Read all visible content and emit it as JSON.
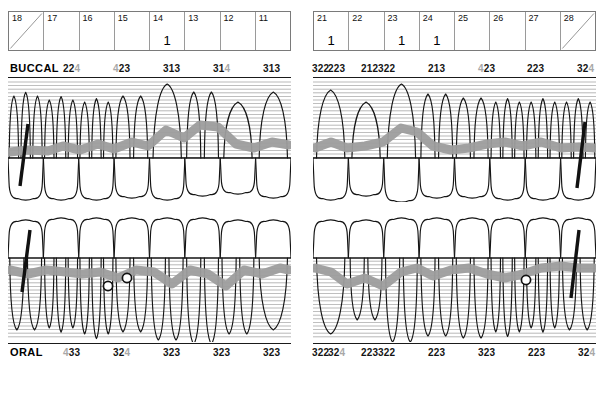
{
  "chart_type": "periodontal-dental-chart",
  "colors": {
    "ink": "#141414",
    "muted_digit": "#a8a8a8",
    "gingiva_band": "#9d9d9d",
    "hatch_line": "#8a8a8a",
    "grid_line": "#7a7a7a"
  },
  "quadrants": {
    "upper_left": {
      "grid_id": "grid-left",
      "tooth_numbers": [
        "18",
        "17",
        "16",
        "15",
        "14",
        "13",
        "12",
        "11"
      ],
      "cell_marks": [
        "",
        "",
        "",
        "",
        "1",
        "",
        "",
        ""
      ],
      "missing_diagonal": [
        true,
        false,
        false,
        false,
        false,
        false,
        false,
        false
      ]
    },
    "upper_right": {
      "grid_id": "grid-right",
      "tooth_numbers": [
        "21",
        "22",
        "23",
        "24",
        "25",
        "26",
        "27",
        "28"
      ],
      "cell_marks": [
        "1",
        "",
        "1",
        "1",
        "",
        "",
        "",
        ""
      ],
      "missing_diagonal": [
        false,
        false,
        false,
        false,
        false,
        false,
        false,
        true
      ]
    }
  },
  "buccal": {
    "label": "BUCCAL",
    "left_values": [
      {
        "digits": "224",
        "gray": [
          false,
          false,
          true
        ]
      },
      {
        "digits": "423",
        "gray": [
          true,
          false,
          false
        ]
      },
      {
        "digits": "313",
        "gray": [
          false,
          false,
          false
        ]
      },
      {
        "digits": "314",
        "gray": [
          false,
          false,
          true
        ]
      },
      {
        "digits": "313",
        "gray": [
          false,
          false,
          false
        ]
      },
      {
        "digits": "322",
        "gray": [
          false,
          false,
          false
        ]
      },
      {
        "digits": "212",
        "gray": [
          false,
          false,
          false
        ]
      }
    ],
    "right_values": [
      {
        "digits": "223",
        "gray": [
          false,
          false,
          false
        ]
      },
      {
        "digits": "322",
        "gray": [
          false,
          false,
          false
        ]
      },
      {
        "digits": "213",
        "gray": [
          false,
          false,
          false
        ]
      },
      {
        "digits": "423",
        "gray": [
          true,
          false,
          false
        ]
      },
      {
        "digits": "223",
        "gray": [
          false,
          false,
          false
        ]
      },
      {
        "digits": "324",
        "gray": [
          false,
          false,
          true
        ]
      },
      {
        "digits": "423",
        "gray": [
          true,
          false,
          false
        ]
      }
    ]
  },
  "oral": {
    "label": "ORAL",
    "left_values": [
      {
        "digits": "433",
        "gray": [
          true,
          false,
          false
        ]
      },
      {
        "digits": "324",
        "gray": [
          false,
          false,
          true
        ]
      },
      {
        "digits": "323",
        "gray": [
          false,
          false,
          false
        ]
      },
      {
        "digits": "323",
        "gray": [
          false,
          false,
          false
        ]
      },
      {
        "digits": "323",
        "gray": [
          false,
          false,
          false
        ]
      },
      {
        "digits": "322",
        "gray": [
          false,
          false,
          false
        ]
      },
      {
        "digits": "223",
        "gray": [
          false,
          false,
          false
        ]
      }
    ],
    "right_values": [
      {
        "digits": "324",
        "gray": [
          false,
          false,
          true
        ]
      },
      {
        "digits": "322",
        "gray": [
          false,
          false,
          false
        ]
      },
      {
        "digits": "223",
        "gray": [
          false,
          false,
          false
        ]
      },
      {
        "digits": "323",
        "gray": [
          false,
          false,
          false
        ]
      },
      {
        "digits": "223",
        "gray": [
          false,
          false,
          false
        ]
      },
      {
        "digits": "324",
        "gray": [
          false,
          false,
          true
        ]
      },
      {
        "digits": "432",
        "gray": [
          true,
          false,
          false
        ]
      }
    ]
  },
  "furcation_markers": {
    "lower_left_count": 2,
    "lower_right_count": 1
  }
}
